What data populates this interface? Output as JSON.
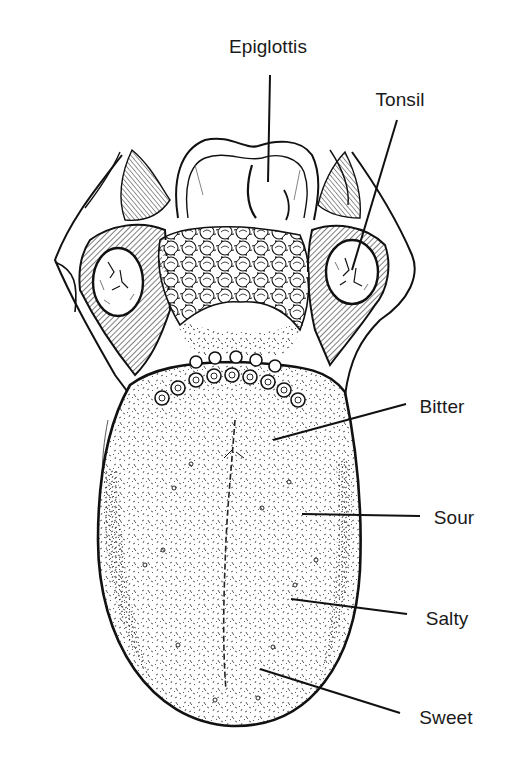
{
  "diagram": {
    "style": "black-and-white pen-and-ink anatomical illustration",
    "background": "#ffffff",
    "ink_color": "#111111",
    "labels": [
      {
        "id": "epiglottis",
        "text": "Epiglottis",
        "x": 268,
        "y": 47,
        "line": [
          270,
          75,
          268,
          182
        ]
      },
      {
        "id": "tonsil",
        "text": "Tonsil",
        "x": 400,
        "y": 100,
        "line": [
          397,
          120,
          352,
          270
        ]
      },
      {
        "id": "bitter",
        "text": "Bitter",
        "x": 442,
        "y": 407,
        "line": [
          406,
          404,
          273,
          440
        ]
      },
      {
        "id": "sour",
        "text": "Sour",
        "x": 454,
        "y": 518,
        "line": [
          420,
          516,
          302,
          514
        ]
      },
      {
        "id": "salty",
        "text": "Salty",
        "x": 447,
        "y": 619,
        "line": [
          407,
          614,
          291,
          599
        ]
      },
      {
        "id": "sweet",
        "text": "Sweet",
        "x": 446,
        "y": 718,
        "line": [
          400,
          713,
          260,
          669
        ]
      }
    ],
    "structures": [
      "epiglottis",
      "left palatine tonsil",
      "right palatine tonsil",
      "lingual tonsil (bumpy tissue at tongue base)",
      "circumvallate papillae (V-shaped row of ringed papillae)",
      "median sulcus",
      "tongue body with filiform/fungiform papillae stippling"
    ]
  }
}
